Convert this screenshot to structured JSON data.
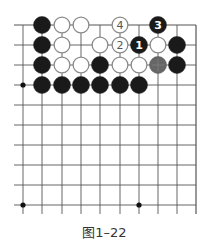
{
  "figure": {
    "caption": "图1–22",
    "type": "go-board-diagram"
  },
  "board": {
    "columns": 10,
    "rows": 10,
    "grid_origin_x": 23,
    "grid_origin_y": 25,
    "col_x": [
      23,
      42,
      62,
      81,
      100,
      120,
      139,
      158,
      177,
      196
    ],
    "row_y": [
      25,
      45,
      65,
      85,
      105,
      125,
      145,
      165,
      185,
      205
    ],
    "top_edge": true,
    "right_edge": true,
    "line_color": "#555555",
    "star_points": [
      [
        0,
        3
      ],
      [
        0,
        9
      ],
      [
        6,
        9
      ]
    ],
    "stone_radius": 8.5
  },
  "stones": [
    {
      "col": 1,
      "row": 0,
      "color": "black",
      "label": ""
    },
    {
      "col": 2,
      "row": 0,
      "color": "white",
      "label": ""
    },
    {
      "col": 3,
      "row": 0,
      "color": "white",
      "label": ""
    },
    {
      "col": 5,
      "row": 0,
      "color": "white",
      "label": "4"
    },
    {
      "col": 7,
      "row": 0,
      "color": "black",
      "label": "3"
    },
    {
      "col": 1,
      "row": 1,
      "color": "black",
      "label": ""
    },
    {
      "col": 2,
      "row": 1,
      "color": "white",
      "label": ""
    },
    {
      "col": 4,
      "row": 1,
      "color": "white",
      "label": ""
    },
    {
      "col": 5,
      "row": 1,
      "color": "white",
      "label": "2"
    },
    {
      "col": 6,
      "row": 1,
      "color": "black",
      "label": "1"
    },
    {
      "col": 7,
      "row": 1,
      "color": "white",
      "label": ""
    },
    {
      "col": 8,
      "row": 1,
      "color": "black",
      "label": ""
    },
    {
      "col": 1,
      "row": 2,
      "color": "black",
      "label": ""
    },
    {
      "col": 2,
      "row": 2,
      "color": "white",
      "label": ""
    },
    {
      "col": 3,
      "row": 2,
      "color": "white",
      "label": ""
    },
    {
      "col": 4,
      "row": 2,
      "color": "black",
      "label": ""
    },
    {
      "col": 5,
      "row": 2,
      "color": "white",
      "label": ""
    },
    {
      "col": 6,
      "row": 2,
      "color": "white",
      "label": ""
    },
    {
      "col": 7,
      "row": 2,
      "color": "gray",
      "label": ""
    },
    {
      "col": 8,
      "row": 2,
      "color": "black",
      "label": ""
    },
    {
      "col": 1,
      "row": 3,
      "color": "black",
      "label": ""
    },
    {
      "col": 2,
      "row": 3,
      "color": "black",
      "label": ""
    },
    {
      "col": 3,
      "row": 3,
      "color": "black",
      "label": ""
    },
    {
      "col": 4,
      "row": 3,
      "color": "black",
      "label": ""
    },
    {
      "col": 5,
      "row": 3,
      "color": "black",
      "label": ""
    },
    {
      "col": 6,
      "row": 3,
      "color": "black",
      "label": ""
    }
  ],
  "colors": {
    "black_stone": "#1a1a1a",
    "white_stone_fill": "#ffffff",
    "white_stone_stroke": "#8a8a8a",
    "gray_stone": "#666666",
    "label_on_black": "#ffffff",
    "label_on_white": "#555555"
  }
}
